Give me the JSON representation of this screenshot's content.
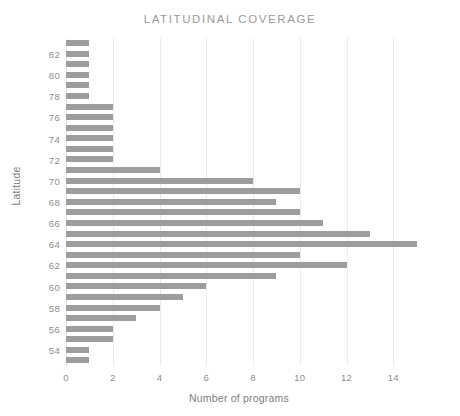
{
  "chart_data": {
    "type": "bar",
    "orientation": "horizontal",
    "title": "LATITUDINAL COVERAGE",
    "xlabel": "Number of programs",
    "ylabel": "Latitude",
    "xlim": [
      0,
      14.8
    ],
    "ylim": [
      52.5,
      83.5
    ],
    "xticks": [
      0,
      2,
      4,
      6,
      8,
      10,
      12,
      14
    ],
    "yticks": [
      54,
      56,
      58,
      60,
      62,
      64,
      66,
      68,
      70,
      72,
      74,
      76,
      78,
      80,
      82
    ],
    "grid": "vertical-only",
    "legend": null,
    "bar_color": "#9d9d9d",
    "categories": [
      83,
      82,
      81,
      80,
      79,
      78,
      77,
      76,
      75,
      74,
      73,
      72,
      71,
      70,
      69,
      68,
      67,
      66,
      65,
      64,
      63,
      62,
      61,
      60,
      59,
      58,
      57,
      56,
      55,
      54,
      53
    ],
    "values": [
      1,
      1,
      1,
      1,
      1,
      1,
      2,
      2,
      2,
      2,
      2,
      2,
      4,
      8,
      10,
      9,
      10,
      11,
      13,
      15,
      10,
      12,
      9,
      6,
      5,
      4,
      3,
      2,
      2,
      1,
      1
    ]
  },
  "axis": {
    "x_tick_labels": [
      "0",
      "2",
      "4",
      "6",
      "8",
      "10",
      "12",
      "14"
    ],
    "y_tick_labels": [
      "82",
      "80",
      "78",
      "76",
      "74",
      "72",
      "70",
      "68",
      "66",
      "64",
      "62",
      "60",
      "58",
      "56",
      "54"
    ]
  }
}
